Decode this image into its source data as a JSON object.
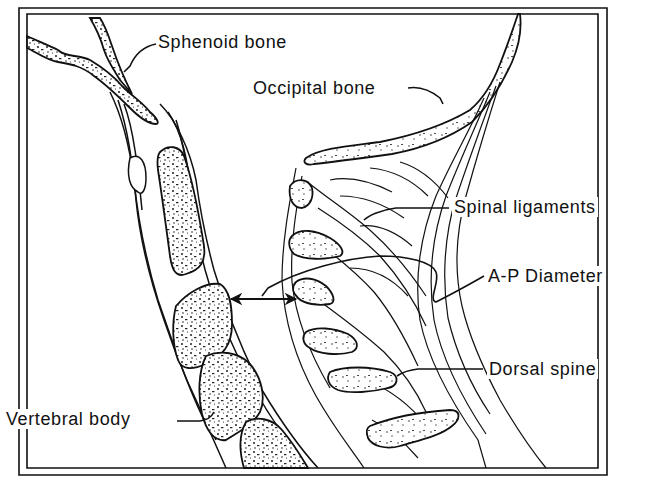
{
  "figure": {
    "type": "anatomical line drawing",
    "colors": {
      "ink": "#111111",
      "background": "#ffffff"
    }
  },
  "labels": {
    "sphenoid": "Sphenoid bone",
    "occipital": "Occipital bone",
    "ligaments": "Spinal ligaments",
    "ap_diameter": "A-P Diameter",
    "dorsal_spine": "Dorsal spine",
    "vertebral_body": "Vertebral body"
  }
}
